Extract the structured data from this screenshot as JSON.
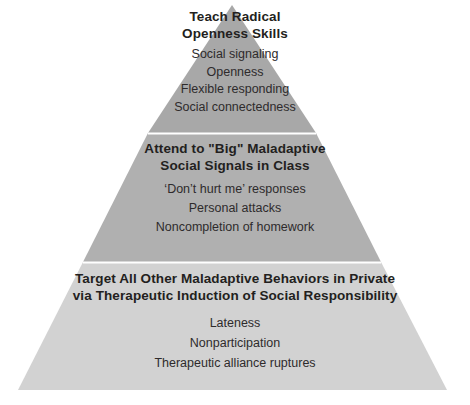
{
  "diagram": {
    "type": "pyramid",
    "tier_count": 3,
    "background_color": "#ffffff",
    "colors": {
      "tier_top_fill": "#a8a8a8",
      "tier_mid_fill": "#b0b0b0",
      "tier_bottom_fill": "#d2d2d2",
      "divider": "#ffffff",
      "heading_text": "#231f20",
      "item_text": "#2e2b2c"
    },
    "geometry": {
      "apex": [
        232,
        5
      ],
      "base_left": [
        18,
        390
      ],
      "base_right": [
        447,
        390
      ],
      "divider_y_upper": 133,
      "divider_y_lower": 262
    },
    "tiers": [
      {
        "id": "top",
        "heading_lines": [
          "Teach Radical",
          "Openness Skills"
        ],
        "items": [
          "Social signaling",
          "Openness",
          "Flexible responding",
          "Social connectedness"
        ]
      },
      {
        "id": "middle",
        "heading_lines": [
          "Attend to \"Big\" Maladaptive",
          "Social Signals in Class"
        ],
        "items": [
          "‘Don’t hurt me’ responses",
          "Personal attacks",
          "Noncompletion of homework"
        ]
      },
      {
        "id": "bottom",
        "heading_lines": [
          "Target All Other Maladaptive Behaviors in Private",
          "via Therapeutic Induction of Social Responsibility"
        ],
        "items": [
          "Lateness",
          "Nonparticipation",
          "Therapeutic alliance ruptures"
        ]
      }
    ]
  }
}
